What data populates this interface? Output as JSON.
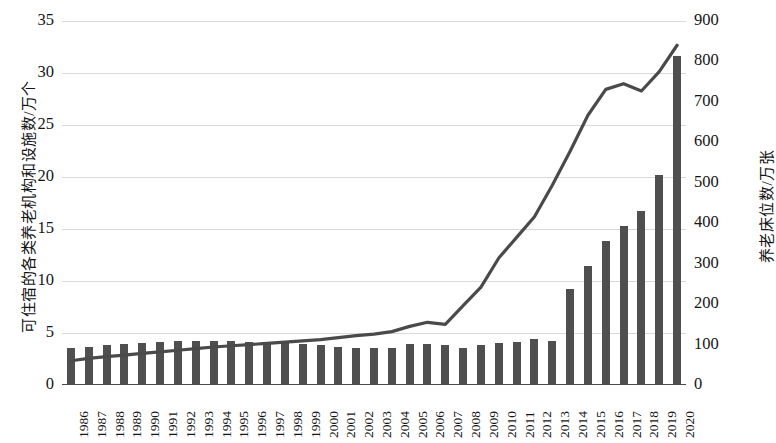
{
  "chart_data": {
    "type": "bar",
    "title": "",
    "subtitle": "",
    "xlabel": "",
    "ylabel": "可住宿的各类养老机构和设施数/万个",
    "y2label": "养老床位数/万张",
    "grid": true,
    "legend": "none",
    "ylim": [
      0,
      35
    ],
    "y2lim": [
      0,
      900
    ],
    "yticks": [
      "0",
      "5",
      "10",
      "15",
      "20",
      "25",
      "30",
      "35"
    ],
    "y2ticks": [
      "0",
      "100",
      "200",
      "300",
      "400",
      "500",
      "600",
      "700",
      "800",
      "900"
    ],
    "categories": [
      "1986",
      "1987",
      "1988",
      "1989",
      "1990",
      "1991",
      "1992",
      "1993",
      "1994",
      "1995",
      "1996",
      "1997",
      "1998",
      "1999",
      "2000",
      "2001",
      "2002",
      "2003",
      "2004",
      "2005",
      "2006",
      "2007",
      "2008",
      "2009",
      "2010",
      "2011",
      "2012",
      "2013",
      "2014",
      "2015",
      "2016",
      "2017",
      "2018",
      "2019",
      "2020"
    ],
    "series": [
      {
        "name": "可住宿的各类养老机构和设施数/万个",
        "type": "bar",
        "axis": "left",
        "unit": "万个",
        "color": "#4f4f4f",
        "values": [
          3.6,
          3.7,
          3.8,
          3.9,
          4.0,
          4.1,
          4.2,
          4.25,
          4.25,
          4.2,
          4.15,
          4.1,
          4.0,
          3.9,
          3.85,
          3.7,
          3.6,
          3.6,
          3.6,
          3.9,
          3.9,
          3.8,
          3.6,
          3.8,
          4.0,
          4.1,
          4.4,
          4.2,
          9.2,
          11.4,
          13.8,
          15.3,
          16.7,
          20.2,
          31.6
        ]
      },
      {
        "name": "养老床位数/万张",
        "type": "line",
        "axis": "right",
        "unit": "万张",
        "color": "#4a4a4a",
        "values": [
          60,
          66,
          70,
          74,
          78,
          82,
          86,
          90,
          94,
          97,
          100,
          103,
          106,
          109,
          112,
          117,
          122,
          126,
          132,
          145,
          155,
          150,
          196,
          242,
          314,
          365,
          416,
          494,
          578,
          667,
          731,
          745,
          727,
          775,
          840
        ]
      }
    ]
  }
}
